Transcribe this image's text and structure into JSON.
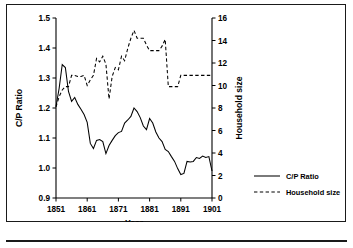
{
  "figure": {
    "has_outer_border": true,
    "has_bottom_rule": true,
    "background_color": "#ffffff",
    "ink_color": "#000000"
  },
  "legend": {
    "position": "right-outside",
    "entries": [
      {
        "label": "C/P Ratio",
        "style": "solid"
      },
      {
        "label": "Household size",
        "style": "dashed"
      }
    ]
  },
  "chart_data": {
    "type": "line",
    "title": "",
    "xlabel": "Year",
    "ylabel": "C/P Ratio",
    "y2label": "Household size",
    "xlim": [
      1851,
      1901
    ],
    "ylim": [
      0.9,
      1.5
    ],
    "y2lim": [
      0,
      16
    ],
    "grid": false,
    "xticks": [
      1851,
      1861,
      1871,
      1881,
      1891,
      1901
    ],
    "xtick_labels": [
      "1851",
      "1861",
      "1871",
      "1881",
      "1891",
      "1901"
    ],
    "yticks": [
      0.9,
      1.0,
      1.1,
      1.2,
      1.3,
      1.4,
      1.5
    ],
    "ytick_labels": [
      "0.9",
      "1.0",
      "1.1",
      "1.2",
      "1.3",
      "1.4",
      "1.5"
    ],
    "y2ticks": [
      0,
      2,
      4,
      6,
      8,
      10,
      12,
      14,
      16
    ],
    "y2tick_labels": [
      "0",
      "2",
      "4",
      "6",
      "8",
      "10",
      "12",
      "14",
      "16"
    ],
    "x": [
      1851,
      1852,
      1853,
      1854,
      1855,
      1856,
      1857,
      1858,
      1859,
      1860,
      1861,
      1862,
      1863,
      1864,
      1865,
      1866,
      1867,
      1868,
      1869,
      1870,
      1871,
      1872,
      1873,
      1874,
      1875,
      1876,
      1877,
      1878,
      1879,
      1880,
      1881,
      1882,
      1883,
      1884,
      1885,
      1886,
      1887,
      1888,
      1889,
      1890,
      1891,
      1892,
      1893,
      1894,
      1895,
      1896,
      1897,
      1898,
      1899,
      1900,
      1901
    ],
    "series": [
      {
        "name": "C/P Ratio",
        "axis": "left",
        "style": "solid",
        "values": [
          1.205,
          1.265,
          1.345,
          1.335,
          1.255,
          1.222,
          1.235,
          1.212,
          1.196,
          1.178,
          1.152,
          1.082,
          1.065,
          1.092,
          1.095,
          1.088,
          1.048,
          1.075,
          1.092,
          1.108,
          1.118,
          1.122,
          1.15,
          1.16,
          1.172,
          1.2,
          1.188,
          1.168,
          1.14,
          1.128,
          1.165,
          1.15,
          1.12,
          1.1,
          1.088,
          1.062,
          1.055,
          1.038,
          1.022,
          0.998,
          0.978,
          0.982,
          1.022,
          1.02,
          1.022,
          1.035,
          1.032,
          1.04,
          1.035,
          1.038,
          0.99
        ]
      },
      {
        "name": "Household size",
        "axis": "right",
        "style": "dashed",
        "values": [
          8.1,
          9.0,
          9.6,
          9.9,
          9.9,
          10.9,
          10.9,
          10.8,
          10.8,
          10.9,
          10.0,
          10.5,
          10.9,
          12.4,
          12.1,
          12.6,
          11.9,
          8.8,
          10.8,
          11.6,
          11.4,
          12.6,
          12.2,
          13.3,
          14.2,
          14.9,
          14.2,
          14.2,
          14.2,
          13.6,
          13.1,
          13.1,
          13.1,
          13.1,
          13.5,
          14.1,
          9.9,
          9.9,
          9.9,
          9.9,
          10.9,
          10.9,
          10.9,
          10.9,
          10.9,
          10.9,
          10.9,
          10.9,
          10.9,
          10.9,
          10.9
        ]
      }
    ]
  }
}
